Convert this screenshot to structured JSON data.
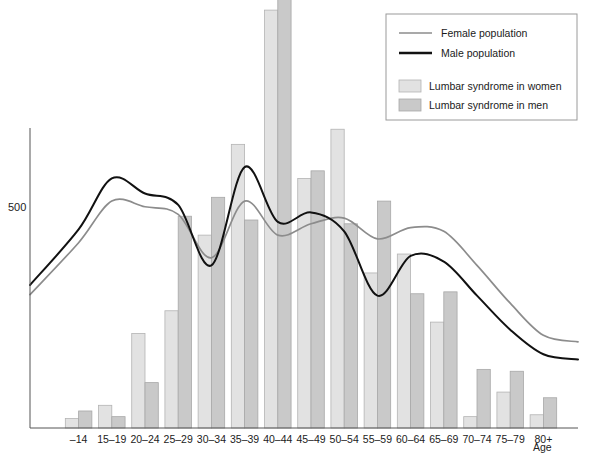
{
  "chart_data": {
    "type": "bar",
    "title": "",
    "xlabel": "Age",
    "ylabel": "",
    "grid": false,
    "legend_position": "top-right",
    "ylim": [
      0,
      1100
    ],
    "yticks": [
      500
    ],
    "ytick_labels": [
      "500"
    ],
    "categories": [
      "–14",
      "15–19",
      "20–24",
      "25–29",
      "30–34",
      "35–39",
      "40–44",
      "45–49",
      "50–54",
      "55–59",
      "60–64",
      "65–69",
      "70–74",
      "75–79",
      "80+"
    ],
    "series": [
      {
        "name": "Lumbar syndrome in women",
        "color": "#e2e2e2",
        "values": [
          25,
          60,
          250,
          310,
          510,
          750,
          1105,
          660,
          790,
          410,
          460,
          280,
          30,
          95,
          35
        ]
      },
      {
        "name": "Lumbar syndrome in men",
        "color": "#c9c9c9",
        "values": [
          45,
          30,
          120,
          560,
          610,
          550,
          1420,
          680,
          540,
          600,
          355,
          360,
          155,
          150,
          80
        ]
      }
    ],
    "curves": [
      {
        "name": "Female population",
        "color": "#8c8c8c",
        "x": [
          "–14",
          "15–19",
          "20–24",
          "25–29",
          "30–34",
          "35–39",
          "40–44",
          "45–49",
          "50–54",
          "55–59",
          "60–64",
          "65–69",
          "70–74",
          "75–79",
          "80+"
        ],
        "values": [
          490,
          600,
          585,
          565,
          450,
          600,
          510,
          540,
          555,
          500,
          530,
          520,
          430,
          330,
          245
        ]
      },
      {
        "name": "Male population",
        "color": "#111111",
        "x": [
          "–14",
          "15–19",
          "20–24",
          "25–29",
          "30–34",
          "35–39",
          "40–44",
          "45–49",
          "50–54",
          "55–59",
          "60–64",
          "65–69",
          "70–74",
          "75–79",
          "80+"
        ],
        "values": [
          525,
          660,
          620,
          590,
          430,
          690,
          545,
          570,
          520,
          350,
          455,
          440,
          350,
          260,
          195
        ]
      }
    ]
  },
  "axes": {
    "y_tick_500": "500",
    "x_axis_title": "Age"
  },
  "legend": {
    "lines": [
      {
        "label": "Female population",
        "swatch": "line-thin-gray"
      },
      {
        "label": "Male population",
        "swatch": "line-thick-black"
      }
    ],
    "bars": [
      {
        "label": "Lumbar syndrome in women",
        "swatch": "box-light-gray"
      },
      {
        "label": "Lumbar syndrome in men",
        "swatch": "box-mid-gray"
      }
    ]
  }
}
